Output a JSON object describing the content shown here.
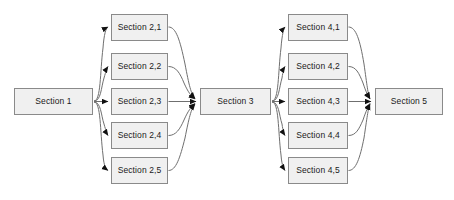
{
  "diagram": {
    "type": "flowchart",
    "orientation": "left-to-right",
    "canvas": {
      "width": 454,
      "height": 200,
      "background": "#ffffff"
    },
    "style": {
      "node_fill": "#f0f0f0",
      "node_border": "#8a8a8a",
      "edge_color": "#6f6f6f",
      "arrowhead_color": "#111111",
      "text_color": "#1a1a1a"
    },
    "stages": [
      {
        "id": "stage-1",
        "name": "Section 1",
        "nodes": [
          {
            "id": "s1",
            "label": "Section 1",
            "x": 14,
            "y": 88,
            "w": 79,
            "h": 27
          }
        ]
      },
      {
        "id": "stage-2",
        "name": "Section 2 group",
        "nodes": [
          {
            "id": "s2-1",
            "label": "Section 2,1",
            "x": 111,
            "y": 14,
            "w": 57,
            "h": 27
          },
          {
            "id": "s2-2",
            "label": "Section 2,2",
            "x": 111,
            "y": 53,
            "w": 57,
            "h": 27
          },
          {
            "id": "s2-3",
            "label": "Section 2,3",
            "x": 111,
            "y": 88,
            "w": 57,
            "h": 27
          },
          {
            "id": "s2-4",
            "label": "Section 2,4",
            "x": 111,
            "y": 122,
            "w": 57,
            "h": 27
          },
          {
            "id": "s2-5",
            "label": "Section 2,5",
            "x": 111,
            "y": 157,
            "w": 57,
            "h": 27
          }
        ]
      },
      {
        "id": "stage-3",
        "name": "Section 3",
        "nodes": [
          {
            "id": "s3",
            "label": "Section 3",
            "x": 200,
            "y": 88,
            "w": 71,
            "h": 27
          }
        ]
      },
      {
        "id": "stage-4",
        "name": "Section 4 group",
        "nodes": [
          {
            "id": "s4-1",
            "label": "Section 4,1",
            "x": 288,
            "y": 14,
            "w": 60,
            "h": 27
          },
          {
            "id": "s4-2",
            "label": "Section 4,2",
            "x": 288,
            "y": 53,
            "w": 60,
            "h": 27
          },
          {
            "id": "s4-3",
            "label": "Section 4,3",
            "x": 288,
            "y": 88,
            "w": 60,
            "h": 27
          },
          {
            "id": "s4-4",
            "label": "Section 4,4",
            "x": 288,
            "y": 122,
            "w": 60,
            "h": 27
          },
          {
            "id": "s4-5",
            "label": "Section 4,5",
            "x": 288,
            "y": 157,
            "w": 60,
            "h": 27
          }
        ]
      },
      {
        "id": "stage-5",
        "name": "Section 5",
        "nodes": [
          {
            "id": "s5",
            "label": "Section 5",
            "x": 375,
            "y": 88,
            "w": 68,
            "h": 27
          }
        ]
      }
    ],
    "edges": [
      {
        "from": "s1",
        "to": "s2-1",
        "kind": "fan-out"
      },
      {
        "from": "s1",
        "to": "s2-2",
        "kind": "fan-out"
      },
      {
        "from": "s1",
        "to": "s2-3",
        "kind": "fan-out"
      },
      {
        "from": "s1",
        "to": "s2-4",
        "kind": "fan-out"
      },
      {
        "from": "s1",
        "to": "s2-5",
        "kind": "fan-out"
      },
      {
        "from": "s2-1",
        "to": "s3",
        "kind": "fan-in"
      },
      {
        "from": "s2-2",
        "to": "s3",
        "kind": "fan-in"
      },
      {
        "from": "s2-3",
        "to": "s3",
        "kind": "fan-in"
      },
      {
        "from": "s2-4",
        "to": "s3",
        "kind": "fan-in"
      },
      {
        "from": "s2-5",
        "to": "s3",
        "kind": "fan-in"
      },
      {
        "from": "s3",
        "to": "s4-1",
        "kind": "fan-out"
      },
      {
        "from": "s3",
        "to": "s4-2",
        "kind": "fan-out"
      },
      {
        "from": "s3",
        "to": "s4-3",
        "kind": "fan-out"
      },
      {
        "from": "s3",
        "to": "s4-4",
        "kind": "fan-out"
      },
      {
        "from": "s3",
        "to": "s4-5",
        "kind": "fan-out"
      },
      {
        "from": "s4-1",
        "to": "s5",
        "kind": "fan-in"
      },
      {
        "from": "s4-2",
        "to": "s5",
        "kind": "fan-in"
      },
      {
        "from": "s4-3",
        "to": "s5",
        "kind": "fan-in"
      },
      {
        "from": "s4-4",
        "to": "s5",
        "kind": "fan-in"
      },
      {
        "from": "s4-5",
        "to": "s5",
        "kind": "fan-in"
      }
    ]
  }
}
